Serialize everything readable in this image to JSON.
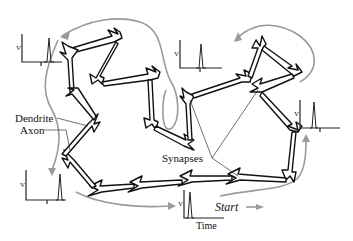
{
  "figure": {
    "labels": {
      "dendrite": "Dendrite",
      "axon": "Axon",
      "synapses": "Synapses",
      "start": "Start"
    },
    "recordings": [
      {
        "id": "top-left",
        "y_label": "V",
        "x_tick": "T"
      },
      {
        "id": "top-center",
        "y_label": "V",
        "x_tick": "T"
      },
      {
        "id": "right",
        "y_label": "V",
        "x_tick": "T"
      },
      {
        "id": "bottom-left",
        "y_label": "V",
        "x_tick": "T"
      },
      {
        "id": "bottom-center",
        "y_label": "V",
        "x_label": "Time"
      }
    ],
    "colors": {
      "neuron_outline": "#111111",
      "signal_flow_arrow": "#9a9a9a",
      "background": "#ffffff"
    }
  }
}
